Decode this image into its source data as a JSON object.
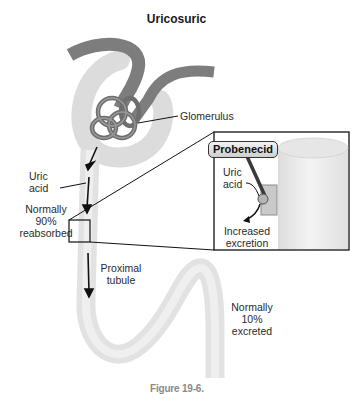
{
  "title": "Uricosuric",
  "labels": {
    "glomerulus": "Glomerulus",
    "uric_acid_line1": "Uric",
    "uric_acid_line2": "acid",
    "reabsorbed_line1": "Normally",
    "reabsorbed_line2": "90%",
    "reabsorbed_line3": "reabsorbed",
    "proximal_line1": "Proximal",
    "proximal_line2": "tubule",
    "excreted_line1": "Normally",
    "excreted_line2": "10%",
    "excreted_line3": "excreted"
  },
  "inset": {
    "drug": "Probenecid",
    "uric_acid_line1": "Uric",
    "uric_acid_line2": "acid",
    "result_line1": "Increased",
    "result_line2": "excretion"
  },
  "caption": "Figure 19-6.",
  "colors": {
    "tubule": "#e4e4e4",
    "vessel": "#7a7a7a",
    "outline": "#111111"
  }
}
